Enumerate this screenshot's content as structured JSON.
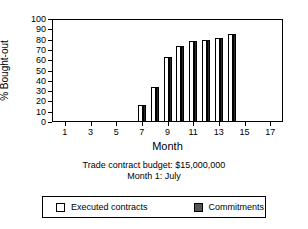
{
  "chart_data": {
    "type": "bar",
    "title": "",
    "xlabel": "Month",
    "ylabel": "% Bought-out",
    "xlim": [
      0,
      18
    ],
    "ylim": [
      0,
      100
    ],
    "grid": false,
    "legend_position": "bottom",
    "x_tick_labels": [
      "1",
      "3",
      "5",
      "7",
      "9",
      "11",
      "13",
      "15",
      "17"
    ],
    "x_tick_values": [
      1,
      3,
      5,
      7,
      9,
      11,
      13,
      15,
      17
    ],
    "y_tick_labels": [
      "0",
      "10",
      "20",
      "30",
      "40",
      "50",
      "60",
      "70",
      "80",
      "90",
      "100"
    ],
    "y_tick_values": [
      0,
      10,
      20,
      30,
      40,
      50,
      60,
      70,
      80,
      90,
      100
    ],
    "categories": [
      7,
      8,
      9,
      10,
      11,
      12,
      13,
      14
    ],
    "series": [
      {
        "name": "Executed contracts",
        "color": "#ffffff",
        "values": [
          16,
          33,
          62,
          73,
          78,
          79,
          81,
          84
        ]
      },
      {
        "name": "Commitments",
        "color": "#2b2b2b",
        "values": [
          16,
          33,
          62,
          73,
          78,
          79,
          81,
          84
        ]
      }
    ],
    "annotations": [
      "Trade contract budget: $15,000,000",
      "Month 1: July"
    ]
  },
  "caption": {
    "line1": "Trade contract budget: $15,000,000",
    "line2": "Month 1: July"
  },
  "legend": {
    "items": [
      {
        "label": "Executed contracts"
      },
      {
        "label": "Commitments"
      }
    ]
  }
}
